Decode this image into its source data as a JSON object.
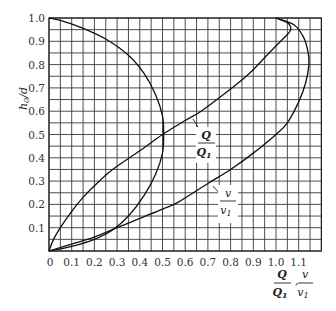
{
  "chart_data": {
    "type": "line",
    "title": "",
    "xlabel": "Q/Q1, v/v1",
    "ylabel": "h0/d",
    "xlim": [
      0,
      1.2
    ],
    "ylim": [
      0,
      1.0
    ],
    "grid": true,
    "grid_step": 0.05,
    "x_ticks": [
      "0",
      "0.1",
      "0.2",
      "0.3",
      "0.4",
      "0.5",
      "0.6",
      "0.7",
      "0.8",
      "0.9",
      "1.0",
      "1.1"
    ],
    "y_ticks": [
      "0.1",
      "0.2",
      "0.3",
      "0.4",
      "0.5",
      "0.6",
      "0.7",
      "0.8",
      "0.9",
      "1.0"
    ],
    "series": [
      {
        "name": "Q/Q1",
        "label_num": "Q",
        "label_den": "Q1",
        "points": [
          [
            0,
            0
          ],
          [
            0.02,
            0.05
          ],
          [
            0.05,
            0.1
          ],
          [
            0.1,
            0.17
          ],
          [
            0.15,
            0.23
          ],
          [
            0.2,
            0.28
          ],
          [
            0.28,
            0.35
          ],
          [
            0.4,
            0.43
          ],
          [
            0.5,
            0.5
          ],
          [
            0.6,
            0.56
          ],
          [
            0.67,
            0.6
          ],
          [
            0.78,
            0.68
          ],
          [
            0.88,
            0.76
          ],
          [
            0.96,
            0.84
          ],
          [
            1.03,
            0.91
          ],
          [
            1.06,
            0.94
          ],
          [
            1.065,
            0.96
          ],
          [
            1.05,
            0.98
          ],
          [
            1.0,
            1.0
          ]
        ]
      },
      {
        "name": "v/v1",
        "label_num": "v",
        "label_den": "v1",
        "points": [
          [
            0,
            0
          ],
          [
            0.1,
            0.03
          ],
          [
            0.2,
            0.06
          ],
          [
            0.3,
            0.1
          ],
          [
            0.4,
            0.14
          ],
          [
            0.5,
            0.18
          ],
          [
            0.57,
            0.21
          ],
          [
            0.7,
            0.29
          ],
          [
            0.8,
            0.35
          ],
          [
            0.9,
            0.42
          ],
          [
            1.0,
            0.5
          ],
          [
            1.05,
            0.55
          ],
          [
            1.1,
            0.64
          ],
          [
            1.13,
            0.72
          ],
          [
            1.145,
            0.8
          ],
          [
            1.14,
            0.86
          ],
          [
            1.12,
            0.92
          ],
          [
            1.08,
            0.97
          ],
          [
            1.0,
            1.0
          ]
        ]
      },
      {
        "name": "unlabeled (semicircular curve)",
        "points": [
          [
            0,
            0
          ],
          [
            0.1,
            0.02
          ],
          [
            0.2,
            0.05
          ],
          [
            0.28,
            0.09
          ],
          [
            0.35,
            0.15
          ],
          [
            0.42,
            0.24
          ],
          [
            0.47,
            0.33
          ],
          [
            0.5,
            0.42
          ],
          [
            0.505,
            0.5
          ],
          [
            0.5,
            0.58
          ],
          [
            0.47,
            0.67
          ],
          [
            0.42,
            0.76
          ],
          [
            0.35,
            0.84
          ],
          [
            0.25,
            0.91
          ],
          [
            0.14,
            0.96
          ],
          [
            0.05,
            0.99
          ],
          [
            0,
            1.0
          ]
        ]
      }
    ]
  },
  "axes": {
    "y_label_main": "h",
    "y_label_sub": "0",
    "y_label_rest": "/d",
    "x_label_q_num": "Q",
    "x_label_q_den": "Q",
    "x_label_q_sub": "1",
    "x_label_sep": ",",
    "x_label_v_num": "v",
    "x_label_v_den": "v",
    "x_label_v_sub": "1"
  },
  "annotations": {
    "q_num": "Q",
    "q_den": "Q",
    "q_sub": "1",
    "v_num": "v",
    "v_den": "v",
    "v_sub": "1"
  }
}
